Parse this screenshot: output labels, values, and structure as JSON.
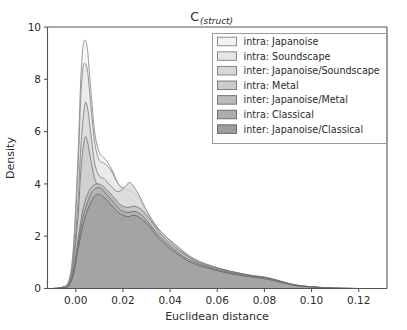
{
  "figure": {
    "title_main": "C",
    "title_sub": "(struct)",
    "background": "#ffffff",
    "axes_color": "#555555"
  },
  "chart_data": {
    "type": "area",
    "xlabel": "Euclidean distance",
    "ylabel": "Density",
    "xlim": [
      -0.012,
      0.132
    ],
    "ylim": [
      0,
      10
    ],
    "xticks": [
      "0.00",
      "0.02",
      "0.04",
      "0.06",
      "0.08",
      "0.10",
      "0.12"
    ],
    "xtick_values": [
      0.0,
      0.02,
      0.04,
      0.06,
      0.08,
      0.1,
      0.12
    ],
    "yticks": [
      "0",
      "2",
      "4",
      "6",
      "8",
      "10"
    ],
    "ytick_values": [
      0,
      2,
      4,
      6,
      8,
      10
    ],
    "grid": false,
    "legend_position": "upper right",
    "series": [
      {
        "name": "intra: Japanoise",
        "color": "#f2f2f2",
        "edge": "#8f8f8f",
        "x": [
          -0.01,
          -0.006,
          -0.003,
          -0.001,
          0.001,
          0.002,
          0.003,
          0.004,
          0.005,
          0.006,
          0.008,
          0.01,
          0.012,
          0.015,
          0.018,
          0.021,
          0.024,
          0.027,
          0.03,
          0.034,
          0.038,
          0.042,
          0.046,
          0.05,
          0.055,
          0.06,
          0.065,
          0.07,
          0.075,
          0.08,
          0.085,
          0.09,
          0.095,
          0.1,
          0.105,
          0.11,
          0.12,
          0.13
        ],
        "y": [
          0.0,
          0.05,
          0.3,
          1.6,
          5.2,
          7.8,
          9.2,
          9.5,
          9.1,
          8.0,
          6.0,
          5.2,
          5.0,
          4.6,
          4.0,
          3.6,
          3.4,
          3.1,
          2.7,
          2.2,
          1.9,
          1.6,
          1.3,
          1.1,
          0.9,
          0.75,
          0.62,
          0.52,
          0.45,
          0.4,
          0.3,
          0.18,
          0.1,
          0.06,
          0.03,
          0.01,
          0.0,
          0.0
        ]
      },
      {
        "name": "intra: Soundscape",
        "color": "#e6e6e6",
        "edge": "#8a8a8a",
        "x": [
          -0.01,
          -0.006,
          -0.003,
          -0.001,
          0.001,
          0.002,
          0.003,
          0.004,
          0.005,
          0.006,
          0.008,
          0.01,
          0.012,
          0.015,
          0.018,
          0.021,
          0.024,
          0.027,
          0.03,
          0.034,
          0.038,
          0.042,
          0.046,
          0.05,
          0.055,
          0.06,
          0.065,
          0.07,
          0.075,
          0.08,
          0.085,
          0.09,
          0.095,
          0.1,
          0.105,
          0.11,
          0.12,
          0.13
        ],
        "y": [
          0.0,
          0.04,
          0.25,
          1.4,
          4.7,
          7.1,
          8.4,
          8.6,
          8.3,
          7.4,
          5.6,
          4.9,
          4.8,
          4.5,
          4.0,
          3.8,
          3.7,
          3.4,
          2.9,
          2.4,
          2.0,
          1.7,
          1.4,
          1.15,
          0.95,
          0.8,
          0.68,
          0.58,
          0.5,
          0.44,
          0.33,
          0.2,
          0.11,
          0.07,
          0.035,
          0.012,
          0.0,
          0.0
        ]
      },
      {
        "name": "inter: Japanoise/Soundscape",
        "color": "#d8d8d8",
        "edge": "#838383",
        "x": [
          -0.01,
          -0.006,
          -0.003,
          -0.001,
          0.001,
          0.002,
          0.003,
          0.004,
          0.005,
          0.006,
          0.008,
          0.01,
          0.012,
          0.015,
          0.018,
          0.021,
          0.023,
          0.026,
          0.03,
          0.034,
          0.038,
          0.042,
          0.046,
          0.05,
          0.055,
          0.06,
          0.065,
          0.07,
          0.075,
          0.08,
          0.085,
          0.09,
          0.095,
          0.1,
          0.105,
          0.11,
          0.12,
          0.13
        ],
        "y": [
          0.0,
          0.03,
          0.2,
          1.1,
          3.4,
          5.2,
          6.4,
          7.1,
          6.9,
          6.2,
          4.8,
          4.3,
          4.2,
          3.9,
          3.7,
          3.9,
          4.05,
          3.7,
          3.0,
          2.4,
          2.0,
          1.65,
          1.35,
          1.1,
          0.9,
          0.78,
          0.66,
          0.56,
          0.48,
          0.42,
          0.32,
          0.19,
          0.1,
          0.06,
          0.03,
          0.01,
          0.0,
          0.0
        ]
      },
      {
        "name": "intra: Metal",
        "color": "#cbcbcb",
        "edge": "#7c7c7c",
        "x": [
          -0.01,
          -0.006,
          -0.003,
          -0.001,
          0.001,
          0.002,
          0.003,
          0.004,
          0.005,
          0.006,
          0.008,
          0.01,
          0.012,
          0.015,
          0.018,
          0.021,
          0.024,
          0.027,
          0.03,
          0.034,
          0.038,
          0.042,
          0.046,
          0.05,
          0.055,
          0.06,
          0.065,
          0.07,
          0.075,
          0.08,
          0.085,
          0.09,
          0.095,
          0.1,
          0.105,
          0.11,
          0.12,
          0.13
        ],
        "y": [
          0.0,
          0.03,
          0.18,
          0.95,
          2.8,
          4.3,
          5.3,
          5.8,
          5.6,
          5.1,
          4.2,
          3.9,
          3.8,
          3.5,
          3.2,
          3.0,
          2.9,
          2.7,
          2.4,
          2.0,
          1.7,
          1.45,
          1.2,
          1.0,
          0.82,
          0.7,
          0.6,
          0.52,
          0.44,
          0.38,
          0.28,
          0.17,
          0.09,
          0.05,
          0.025,
          0.008,
          0.0,
          0.0
        ]
      },
      {
        "name": "inter: Japanoise/Metal",
        "color": "#bcbcbc",
        "edge": "#757575",
        "x": [
          -0.01,
          -0.006,
          -0.003,
          -0.001,
          0.001,
          0.003,
          0.005,
          0.007,
          0.009,
          0.011,
          0.013,
          0.016,
          0.019,
          0.022,
          0.025,
          0.028,
          0.031,
          0.035,
          0.039,
          0.043,
          0.047,
          0.051,
          0.056,
          0.061,
          0.066,
          0.071,
          0.076,
          0.081,
          0.086,
          0.091,
          0.096,
          0.101,
          0.106,
          0.111,
          0.12,
          0.13
        ],
        "y": [
          0.0,
          0.02,
          0.14,
          0.7,
          1.9,
          3.0,
          3.6,
          3.9,
          4.0,
          3.95,
          3.8,
          3.5,
          3.2,
          3.1,
          3.15,
          3.0,
          2.7,
          2.2,
          1.8,
          1.5,
          1.25,
          1.05,
          0.88,
          0.75,
          0.64,
          0.55,
          0.47,
          0.42,
          0.3,
          0.18,
          0.1,
          0.06,
          0.03,
          0.01,
          0.0,
          0.0
        ]
      },
      {
        "name": "intra: Classical",
        "color": "#aeaeae",
        "edge": "#6e6e6e",
        "x": [
          -0.01,
          -0.006,
          -0.003,
          -0.001,
          0.001,
          0.003,
          0.005,
          0.007,
          0.009,
          0.011,
          0.013,
          0.016,
          0.019,
          0.022,
          0.025,
          0.028,
          0.031,
          0.035,
          0.039,
          0.043,
          0.047,
          0.051,
          0.056,
          0.061,
          0.066,
          0.071,
          0.076,
          0.081,
          0.086,
          0.091,
          0.096,
          0.101,
          0.106,
          0.111,
          0.12,
          0.13
        ],
        "y": [
          0.0,
          0.02,
          0.12,
          0.6,
          1.7,
          2.7,
          3.3,
          3.7,
          3.85,
          3.8,
          3.6,
          3.3,
          3.0,
          2.9,
          2.95,
          2.8,
          2.5,
          2.05,
          1.7,
          1.4,
          1.15,
          0.98,
          0.82,
          0.7,
          0.6,
          0.52,
          0.45,
          0.4,
          0.28,
          0.16,
          0.09,
          0.05,
          0.025,
          0.008,
          0.0,
          0.0
        ]
      },
      {
        "name": "inter: Japanoise/Classical",
        "color": "#9e9e9e",
        "edge": "#666666",
        "x": [
          -0.01,
          -0.006,
          -0.003,
          -0.001,
          0.001,
          0.003,
          0.005,
          0.007,
          0.009,
          0.011,
          0.013,
          0.016,
          0.019,
          0.022,
          0.025,
          0.028,
          0.031,
          0.035,
          0.039,
          0.043,
          0.047,
          0.051,
          0.056,
          0.061,
          0.066,
          0.071,
          0.076,
          0.081,
          0.086,
          0.091,
          0.096,
          0.101,
          0.106,
          0.111,
          0.12,
          0.13
        ],
        "y": [
          0.0,
          0.02,
          0.1,
          0.55,
          1.5,
          2.4,
          3.0,
          3.4,
          3.6,
          3.55,
          3.4,
          3.1,
          2.85,
          2.75,
          2.8,
          2.65,
          2.4,
          1.95,
          1.6,
          1.32,
          1.08,
          0.92,
          0.78,
          0.66,
          0.56,
          0.48,
          0.42,
          0.36,
          0.26,
          0.15,
          0.08,
          0.05,
          0.02,
          0.007,
          0.0,
          0.0
        ]
      }
    ]
  }
}
